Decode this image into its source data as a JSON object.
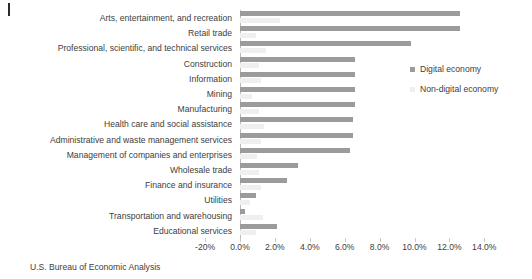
{
  "footer": {
    "source": "U.S. Bureau of Economic Analysis"
  },
  "legend": {
    "items": [
      {
        "label": "Digital economy",
        "color": "#9b9b9b"
      },
      {
        "label": "Non-digital economy",
        "color": "#efefef"
      }
    ]
  },
  "axis": {
    "ticks": [
      "-20%",
      "0.0%",
      "2.0%",
      "4.0%",
      "6.0%",
      "8.0%",
      "10.0%",
      "12.0%",
      "14.0%"
    ],
    "tick_values": [
      -2.0,
      0.0,
      2.0,
      4.0,
      6.0,
      8.0,
      10.0,
      12.0,
      14.0
    ]
  },
  "chart_data": {
    "type": "bar",
    "orientation": "horizontal",
    "title": "",
    "xlabel": "",
    "ylabel": "",
    "xlim": [
      -2.0,
      14.0
    ],
    "grid": false,
    "legend_position": "right",
    "categories": [
      "Arts, entertainment, and recreation",
      "Retail trade",
      "Professional, scientific, and technical services",
      "Construction",
      "Information",
      "Mining",
      "Manufacturing",
      "Health care and social assistance",
      "Administrative and waste management services",
      "Management of companies and enterprises",
      "Wholesale trade",
      "Finance and insurance",
      "Utilities",
      "Transportation and warehousing",
      "Educational services"
    ],
    "series": [
      {
        "name": "Digital economy",
        "color": "#9b9b9b",
        "values": [
          12.6,
          12.6,
          9.8,
          6.6,
          6.6,
          6.6,
          6.6,
          6.5,
          6.5,
          6.3,
          3.3,
          2.7,
          0.9,
          0.3,
          2.1
        ]
      },
      {
        "name": "Non-digital economy",
        "color": "#efefef",
        "values": [
          2.3,
          0.9,
          1.5,
          1.1,
          1.2,
          0.7,
          1.1,
          1.4,
          1.2,
          1.0,
          1.1,
          1.2,
          0.6,
          1.3,
          0.9
        ]
      }
    ]
  }
}
